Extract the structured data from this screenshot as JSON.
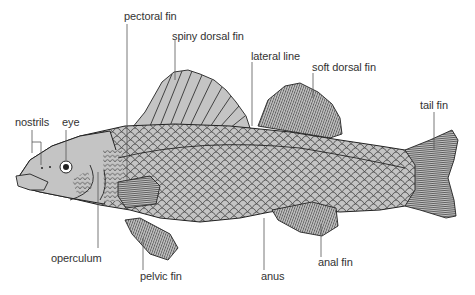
{
  "diagram": {
    "colors": {
      "body_fill": "#c4c4c4",
      "outline": "#222222",
      "leader_line": "#555555",
      "label_text": "#333333",
      "background": "#ffffff"
    },
    "labels": [
      {
        "id": "pectoral-fin",
        "text": "pectoral fin"
      },
      {
        "id": "spiny-dorsal-fin",
        "text": "spiny dorsal fin"
      },
      {
        "id": "lateral-line",
        "text": "lateral line"
      },
      {
        "id": "soft-dorsal-fin",
        "text": "soft dorsal fin"
      },
      {
        "id": "tail-fin",
        "text": "tail fin"
      },
      {
        "id": "nostrils",
        "text": "nostrils"
      },
      {
        "id": "eye",
        "text": "eye"
      },
      {
        "id": "operculum",
        "text": "operculum"
      },
      {
        "id": "pelvic-fin",
        "text": "pelvic fin"
      },
      {
        "id": "anus",
        "text": "anus"
      },
      {
        "id": "anal-fin",
        "text": "anal fin"
      }
    ]
  }
}
